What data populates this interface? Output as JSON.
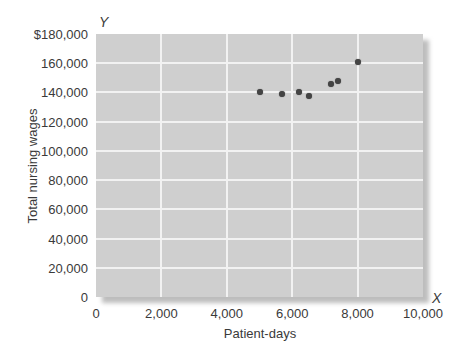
{
  "chart_data": {
    "type": "scatter",
    "title": "",
    "xlabel": "Patient-days",
    "ylabel": "Total nursing wages",
    "x_axis_letter": "X",
    "y_axis_letter": "Y",
    "xlim": [
      0,
      10000
    ],
    "ylim": [
      0,
      180000
    ],
    "grid": true,
    "legend": null,
    "x_ticks": [
      0,
      2000,
      4000,
      6000,
      8000,
      10000
    ],
    "x_tick_labels": [
      "0",
      "2,000",
      "4,000",
      "6,000",
      "8,000",
      "10,000"
    ],
    "y_ticks": [
      0,
      20000,
      40000,
      60000,
      80000,
      100000,
      120000,
      140000,
      160000,
      180000
    ],
    "y_tick_labels": [
      "0",
      "20,000",
      "40,000",
      "60,000",
      "80,000",
      "100,000",
      "120,000",
      "140,000",
      "160,000",
      "$180,000"
    ],
    "series": [
      {
        "name": "Observations",
        "points": [
          {
            "x": 5000,
            "y": 140000
          },
          {
            "x": 5700,
            "y": 139000
          },
          {
            "x": 6200,
            "y": 140000
          },
          {
            "x": 6500,
            "y": 137500
          },
          {
            "x": 7200,
            "y": 146000
          },
          {
            "x": 7400,
            "y": 148000
          },
          {
            "x": 8000,
            "y": 161000
          }
        ]
      }
    ],
    "colors": {
      "plot_bg": "#cfcfcf",
      "grid": "#f2f2f2",
      "point": "#444444",
      "text": "#3a3a3a"
    }
  }
}
